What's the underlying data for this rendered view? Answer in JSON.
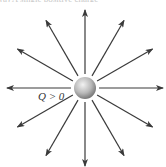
{
  "caption_fragment": "(a) A single positive charge",
  "diagram": {
    "charge_label": "Q > 0",
    "center": [
      85,
      88
    ],
    "sphere_radius": 11,
    "line_inner_radius": 14,
    "line_outer_radius": 78,
    "line_count": 12,
    "angle_step_deg": 30,
    "line_color": "#3a3a3a",
    "sphere_colors": {
      "highlight": "#f2f2f2",
      "mid": "#b8b8b8",
      "shadow": "#7a7a7a"
    }
  }
}
